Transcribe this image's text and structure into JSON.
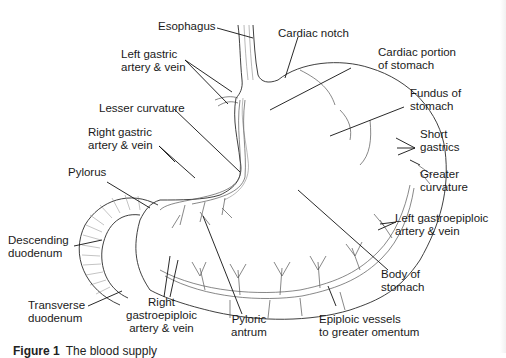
{
  "figure": {
    "caption_label": "Figure 1",
    "caption_text": "The blood supply"
  },
  "labels": {
    "esophagus": "Esophagus",
    "cardiac_notch": "Cardiac notch",
    "left_gastric_1": "Left gastric",
    "left_gastric_2": "artery & vein",
    "cardiac_portion_1": "Cardiac portion",
    "cardiac_portion_2": "of stomach",
    "lesser_curvature": "Lesser curvature",
    "fundus_1": "Fundus of",
    "fundus_2": "stomach",
    "right_gastric_1": "Right gastric",
    "right_gastric_2": "artery & vein",
    "short_gastrics_1": "Short",
    "short_gastrics_2": "gastrics",
    "pylorus": "Pylorus",
    "greater_curvature_1": "Greater",
    "greater_curvature_2": "curvature",
    "left_gastroepiploic_1": "Left gastroepiploic",
    "left_gastroepiploic_2": "artery & vein",
    "descending_duodenum_1": "Descending",
    "descending_duodenum_2": "duodenum",
    "body_1": "Body of",
    "body_2": "stomach",
    "transverse_duodenum_1": "Transverse",
    "transverse_duodenum_2": "duodenum",
    "right_gastroepiploic_1": "Right",
    "right_gastroepiploic_2": "gastroepiploic",
    "right_gastroepiploic_3": "artery & vein",
    "pyloric_antrum_1": "Pyloric",
    "pyloric_antrum_2": "antrum",
    "epiploic_1": "Epiploic vessels",
    "epiploic_2": "to greater omentum"
  },
  "colors": {
    "outline": "#2a2a2a",
    "vessel": "#555555",
    "leader": "#111111",
    "text": "#1a1a1a"
  }
}
